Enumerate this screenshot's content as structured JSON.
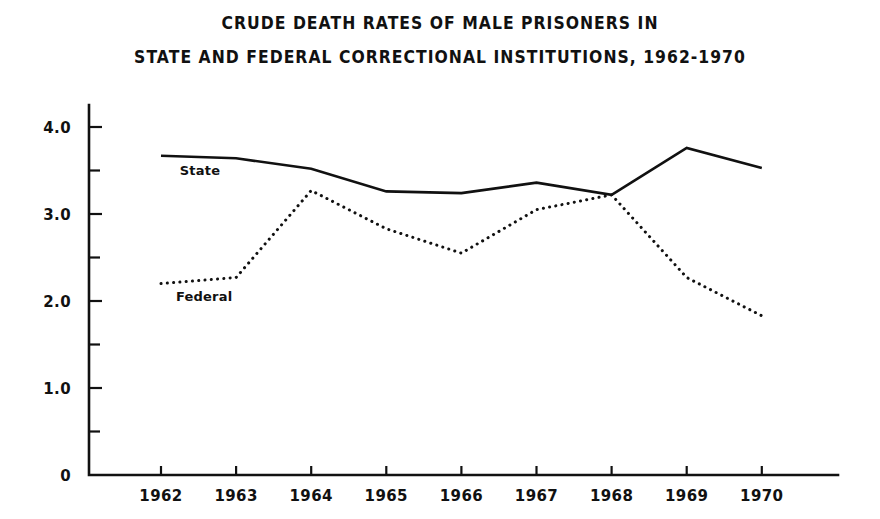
{
  "title": {
    "line1": "CRUDE DEATH RATES OF MALE PRISONERS IN",
    "line2": "STATE AND FEDERAL CORRECTIONAL INSTITUTIONS, 1962-1970"
  },
  "chart_data": {
    "type": "line",
    "title": "CRUDE DEATH RATES OF MALE PRISONERS IN STATE AND FEDERAL CORRECTIONAL INSTITUTIONS, 1962-1970",
    "xlabel": "",
    "ylabel": "",
    "x": [
      1962,
      1963,
      1964,
      1965,
      1966,
      1967,
      1968,
      1969,
      1970
    ],
    "categories": [
      "1962",
      "1963",
      "1964",
      "1965",
      "1966",
      "1967",
      "1968",
      "1969",
      "1970"
    ],
    "xlim": [
      1962,
      1970
    ],
    "ylim": [
      0,
      4.3
    ],
    "grid": false,
    "legend_position": "inline-annotation",
    "y_ticks_major": [
      "0",
      "1.0",
      "2.0",
      "3.0",
      "4.0"
    ],
    "y_tick_values_major": [
      0,
      1.0,
      2.0,
      3.0,
      4.0
    ],
    "y_tick_values_minor": [
      0.5,
      1.5,
      2.5,
      3.5
    ],
    "series": [
      {
        "name": "State",
        "style": "solid",
        "color": "#111111",
        "values": [
          3.67,
          3.64,
          3.52,
          3.26,
          3.24,
          3.36,
          3.22,
          3.76,
          3.53
        ]
      },
      {
        "name": "Federal",
        "style": "dotted",
        "color": "#111111",
        "values": [
          2.2,
          2.27,
          3.27,
          2.83,
          2.55,
          3.05,
          3.22,
          2.27,
          1.83
        ]
      }
    ],
    "annotations": [
      {
        "text": "State",
        "series": "State",
        "x": 1962.25,
        "y": 3.45
      },
      {
        "text": "Federal",
        "series": "Federal",
        "x": 1962.2,
        "y": 2.0
      }
    ]
  }
}
